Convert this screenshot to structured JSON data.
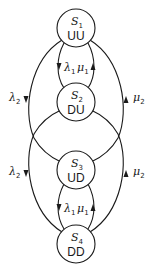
{
  "diagram": {
    "type": "state-transition",
    "nodes": [
      {
        "id": "S1",
        "symbol": "S",
        "index": "1",
        "label": "UU"
      },
      {
        "id": "S2",
        "symbol": "S",
        "index": "2",
        "label": "DU"
      },
      {
        "id": "S3",
        "symbol": "S",
        "index": "3",
        "label": "UD"
      },
      {
        "id": "S4",
        "symbol": "S",
        "index": "4",
        "label": "DD"
      }
    ],
    "edges": [
      {
        "from": "S1",
        "to": "S2",
        "rate": "λ",
        "index": "1"
      },
      {
        "from": "S2",
        "to": "S1",
        "rate": "μ",
        "index": "1"
      },
      {
        "from": "S3",
        "to": "S4",
        "rate": "λ",
        "index": "1"
      },
      {
        "from": "S4",
        "to": "S3",
        "rate": "μ",
        "index": "1"
      },
      {
        "from": "S1",
        "to": "S3",
        "rate": "λ",
        "index": "2"
      },
      {
        "from": "S3",
        "to": "S1",
        "rate": "μ",
        "index": "2"
      },
      {
        "from": "S2",
        "to": "S4",
        "rate": "λ",
        "index": "2"
      },
      {
        "from": "S4",
        "to": "S2",
        "rate": "μ",
        "index": "2"
      }
    ],
    "colors": {
      "stroke": "#1a1a1a",
      "background": "#ffffff"
    }
  }
}
